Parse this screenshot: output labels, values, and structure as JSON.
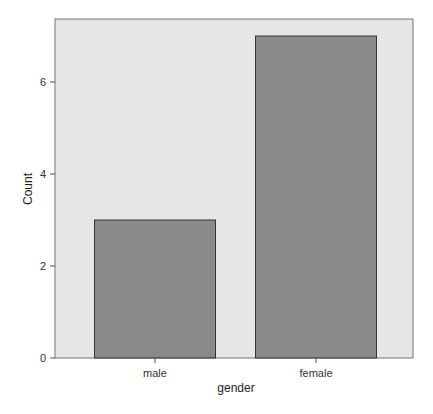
{
  "chart_data": {
    "type": "bar",
    "title": "",
    "xlabel": "gender",
    "ylabel": "Count",
    "categories": [
      "male",
      "female"
    ],
    "values": [
      3,
      7
    ],
    "ylim": [
      0,
      7.3
    ],
    "yticks": [
      0,
      2,
      4,
      6
    ],
    "grid": false,
    "legend": null,
    "colors": {
      "panel_background": "#e6e6e6",
      "bar_fill": "#8a8a8a",
      "bar_stroke": "#333333",
      "axis": "#555555"
    }
  }
}
